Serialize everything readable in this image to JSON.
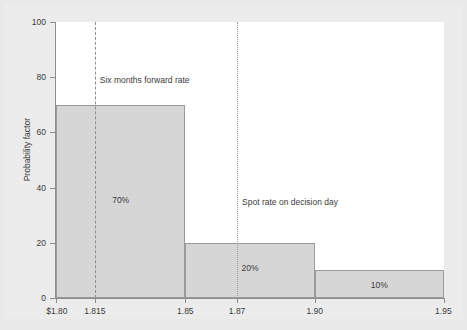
{
  "chart_data": {
    "type": "bar",
    "title": "",
    "subtitle": "",
    "xlabel": "",
    "ylabel": "Probability factor",
    "ylim": [
      0,
      100
    ],
    "xlim": [
      1.8,
      1.95
    ],
    "grid": false,
    "legend": "none",
    "y_ticks": [
      {
        "value": 100,
        "label": "100"
      },
      {
        "value": 80,
        "label": "80"
      },
      {
        "value": 60,
        "label": "60"
      },
      {
        "value": 40,
        "label": "40"
      },
      {
        "value": 20,
        "label": "20"
      },
      {
        "value": 0,
        "label": "0"
      }
    ],
    "x_ticks": [
      {
        "value": 1.8,
        "label": "$1.80"
      },
      {
        "value": 1.815,
        "label": "1.815"
      },
      {
        "value": 1.85,
        "label": "1.85"
      },
      {
        "value": 1.87,
        "label": "1.87"
      },
      {
        "value": 1.9,
        "label": "1.90"
      },
      {
        "value": 1.95,
        "label": "1.95"
      }
    ],
    "bars": [
      {
        "x_start": 1.8,
        "x_end": 1.85,
        "value": 70,
        "label": "70%"
      },
      {
        "x_start": 1.85,
        "x_end": 1.9,
        "value": 20,
        "label": "20%"
      },
      {
        "x_start": 1.9,
        "x_end": 1.95,
        "value": 10,
        "label": "10%"
      }
    ],
    "categories": [
      "1.80-1.85",
      "1.85-1.90",
      "1.90-1.95"
    ],
    "values": [
      70,
      20,
      10
    ],
    "annotations": [
      {
        "x": 1.815,
        "label": "Six months forward rate",
        "line_style": "dashed"
      },
      {
        "x": 1.87,
        "label": "Spot rate on decision day",
        "line_style": "dotted"
      }
    ],
    "colors": {
      "bar_fill": "#d6d6d6",
      "bar_border": "#9a9a9a",
      "axis": "#8d8d8d",
      "text": "#3b3b3b",
      "plot_background": "#ffffff",
      "page_background": "#e9e9e9"
    }
  }
}
